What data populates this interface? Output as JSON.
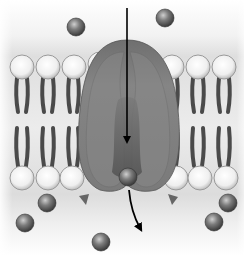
{
  "diagram": {
    "label_top": "being carried",
    "colors": {
      "background_edge": "#ffffff",
      "background_membrane": "#d9d9d9",
      "lipid_head": "#f4f4f4",
      "lipid_tail": "#4a4a4a",
      "protein_outer": "#7a7a7a",
      "protein_inner": "#5a5a5a",
      "solute": "#6a6a6a",
      "arrow": "#000000"
    },
    "solutes_outside": 2,
    "solutes_inside": 5,
    "solute_in_channel": 1
  }
}
